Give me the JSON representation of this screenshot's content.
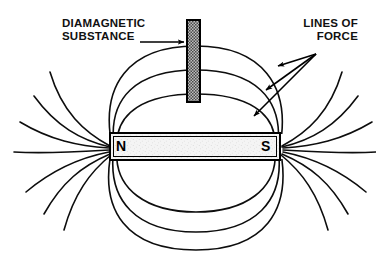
{
  "figure": {
    "background_color": "#ffffff",
    "ink_color": "#000000",
    "labels": {
      "diamagnetic": {
        "line1": "DIAMAGNETIC",
        "line2": "SUBSTANCE",
        "text": "DIAMAGNETIC\nSUBSTANCE"
      },
      "lines_of_force": {
        "line1": "LINES OF",
        "line2": "FORCE",
        "text": "LINES OF\nFORCE"
      }
    },
    "magnet": {
      "north_pole_label": "N",
      "south_pole_label": "S",
      "fill_color": "#f2f2f2",
      "outline_color": "#000000"
    },
    "rod": {
      "name": "diamagnetic-rod",
      "fill_color": "#8a8a8a",
      "outline_color": "#000000"
    },
    "field_lines": {
      "closed_loops_above": 3,
      "closed_loops_below": 3,
      "open_lines_left": 7,
      "open_lines_right": 7
    },
    "pointers": {
      "diamagnetic_arrow_count": 1,
      "lines_of_force_arrow_count": 3
    }
  }
}
